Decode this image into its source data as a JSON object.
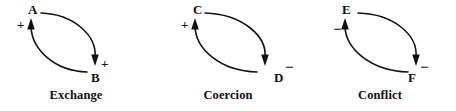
{
  "figure": {
    "background_color": "#ffffff",
    "stroke_color": "#111111",
    "width": 456,
    "height": 111
  },
  "panels": [
    {
      "id": "exchange",
      "caption": "Exchange",
      "top_node": {
        "label": "A",
        "sign": "+"
      },
      "bottom_node": {
        "label": "B",
        "sign": "+"
      },
      "edges": [
        {
          "name": "top-to-bottom",
          "from": "A",
          "to": "B",
          "sign": "+",
          "direction": "clockwise-right"
        },
        {
          "name": "bottom-to-top",
          "from": "B",
          "to": "A",
          "sign": "+",
          "direction": "clockwise-left"
        }
      ]
    },
    {
      "id": "coercion",
      "caption": "Coercion",
      "top_node": {
        "label": "C",
        "sign": "+"
      },
      "bottom_node": {
        "label": "D",
        "sign": "−"
      },
      "edges": [
        {
          "name": "top-to-bottom",
          "from": "C",
          "to": "D",
          "sign": "−",
          "direction": "clockwise-right"
        },
        {
          "name": "bottom-to-top",
          "from": "D",
          "to": "C",
          "sign": "+",
          "direction": "clockwise-left"
        }
      ]
    },
    {
      "id": "conflict",
      "caption": "Conflict",
      "top_node": {
        "label": "E",
        "sign": "−"
      },
      "bottom_node": {
        "label": "F",
        "sign": "−"
      },
      "edges": [
        {
          "name": "top-to-bottom",
          "from": "E",
          "to": "F",
          "sign": "−",
          "direction": "clockwise-right"
        },
        {
          "name": "bottom-to-top",
          "from": "F",
          "to": "E",
          "sign": "−",
          "direction": "clockwise-left"
        }
      ]
    }
  ]
}
